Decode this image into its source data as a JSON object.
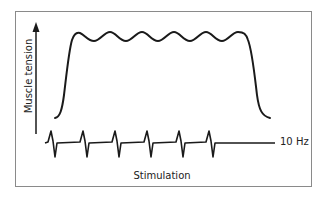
{
  "diagram": {
    "y_axis_label": "Muscle tension",
    "x_axis_label": "Stimulation",
    "frequency_label": "10 Hz",
    "line_color": "#1a1a1a",
    "frame_color": "#8a8a8a",
    "tension_curve": {
      "description": "Unfused (incomplete) tetanus: tension rises to a plateau with 6 ripples, then falls",
      "ripple_count": 6
    },
    "stimulation_trace": {
      "description": "Biphasic stimulus pulses on a baseline",
      "pulse_count": 6
    }
  }
}
